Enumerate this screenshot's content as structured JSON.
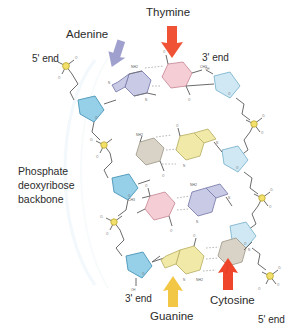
{
  "figure": {
    "background_color": "#ffffff",
    "text_color": "#2b2b2b"
  },
  "labels": {
    "adenine": "Adenine",
    "thymine": "Thymine",
    "guanine": "Guanine",
    "cytosine": "Cytosine",
    "five_prime_top": "5' end",
    "three_prime_top": "3' end",
    "three_prime_bottom": "3' end",
    "five_prime_bottom": "5' end",
    "backbone_line1": "Phosphate",
    "backbone_line2": "deoxyribose",
    "backbone_line3": "backbone"
  },
  "arrows": [
    {
      "name": "adenine-arrow",
      "points_to": "Adenine",
      "direction": "down-right",
      "color": "#8e8fc4"
    },
    {
      "name": "thymine-arrow",
      "points_to": "Thymine",
      "direction": "down",
      "color": "#ef4a22"
    },
    {
      "name": "guanine-arrow",
      "points_to": "Guanine",
      "direction": "up",
      "color": "#f2c43c"
    },
    {
      "name": "cytosine-arrow",
      "points_to": "Cytosine",
      "direction": "up",
      "color": "#ee3b20"
    }
  ],
  "colors": {
    "adenine_fill": "#c9cbe6",
    "thymine_fill": "#f5cdd4",
    "guanine_fill": "#f0e9a8",
    "cytosine_fill": "#d8d3c6",
    "sugar_fill": "#96cfe8",
    "sugar_fill_pale": "#cfe8f3",
    "phosphate_fill": "#f2e06a",
    "bond_stroke": "#6b6b6b",
    "hbond_stroke": "#9a9a9a"
  },
  "base_pairs": [
    {
      "index": 1,
      "left_base": "Adenine",
      "right_base": "Thymine",
      "hydrogen_bonds": 2
    },
    {
      "index": 2,
      "left_base": "Cytosine",
      "right_base": "Guanine",
      "hydrogen_bonds": 3
    },
    {
      "index": 3,
      "left_base": "Thymine",
      "right_base": "Adenine",
      "hydrogen_bonds": 2
    },
    {
      "index": 4,
      "left_base": "Guanine",
      "right_base": "Cytosine",
      "hydrogen_bonds": 3
    }
  ],
  "atom_labels": {
    "amine": "NH2",
    "nitrogen": "N",
    "oxygen": "O",
    "hydroxyl": "OH",
    "phosphorus": "P",
    "methyl": "CH3",
    "negative": "O-"
  }
}
